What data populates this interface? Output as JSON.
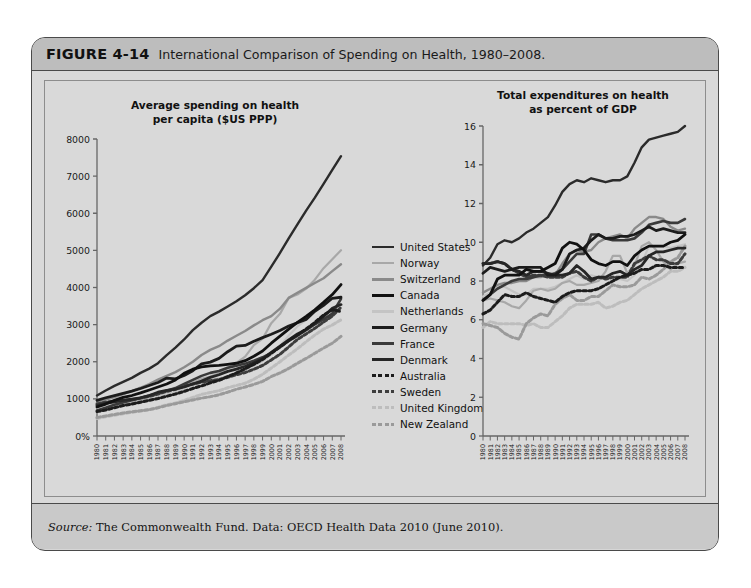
{
  "figure": {
    "number": "FIGURE 4-14",
    "caption": "International Comparison of Spending on Health, 1980–2008.",
    "source_prefix": "Source:",
    "source_text": " The Commonwealth Fund. Data: OECD Health Data 2010 (June 2010)."
  },
  "legend": {
    "items": [
      {
        "label": "United States",
        "color": "#2b2b2b",
        "style": "solid",
        "width": 2.4
      },
      {
        "label": "Norway",
        "color": "#a8a8a8",
        "style": "solid",
        "width": 2.2
      },
      {
        "label": "Switzerland",
        "color": "#8a8a8a",
        "style": "solid",
        "width": 2.4
      },
      {
        "label": "Canada",
        "color": "#111111",
        "style": "solid",
        "width": 2.8
      },
      {
        "label": "Netherlands",
        "color": "#c4c4c4",
        "style": "solid",
        "width": 2.2
      },
      {
        "label": "Germany",
        "color": "#1c1c1c",
        "style": "solid",
        "width": 2.8
      },
      {
        "label": "France",
        "color": "#3a3a3a",
        "style": "solid",
        "width": 2.6
      },
      {
        "label": "Denmark",
        "color": "#262626",
        "style": "solid",
        "width": 2.8
      },
      {
        "label": "Australia",
        "color": "#1c1c1c",
        "style": "dashed",
        "width": 3.0
      },
      {
        "label": "Sweden",
        "color": "#3d3d3d",
        "style": "dashed",
        "width": 3.0
      },
      {
        "label": "United Kingdom",
        "color": "#bdbdbd",
        "style": "dashed",
        "width": 3.0
      },
      {
        "label": "New Zealand",
        "color": "#9a9a9a",
        "style": "dashed",
        "width": 3.0
      }
    ]
  },
  "chart_data": [
    {
      "id": "spending-per-capita",
      "type": "line",
      "title": "Average spending on health\nper capita ($US PPP)",
      "xlabel": "",
      "ylabel": "",
      "ylim": [
        0,
        8000
      ],
      "yticks": [
        0,
        1000,
        2000,
        3000,
        4000,
        5000,
        6000,
        7000,
        8000
      ],
      "ytick_labels": [
        "0%",
        "1000",
        "2000",
        "3000",
        "4000",
        "5000",
        "6000",
        "7000",
        "8000"
      ],
      "grid": false,
      "legend_position": "right",
      "x": [
        1980,
        1981,
        1982,
        1983,
        1984,
        1985,
        1986,
        1987,
        1988,
        1989,
        1990,
        1991,
        1992,
        1993,
        1994,
        1995,
        1996,
        1997,
        1998,
        1999,
        2000,
        2001,
        2002,
        2003,
        2004,
        2005,
        2006,
        2007,
        2008
      ],
      "series": [
        {
          "name": "United States",
          "values": [
            1091,
            1226,
            1350,
            1460,
            1565,
            1700,
            1815,
            1960,
            2180,
            2380,
            2600,
            2850,
            3050,
            3230,
            3350,
            3490,
            3630,
            3790,
            3980,
            4200,
            4560,
            4930,
            5320,
            5700,
            6070,
            6420,
            6790,
            7170,
            7538
          ]
        },
        {
          "name": "Norway",
          "values": [
            680,
            740,
            790,
            840,
            890,
            960,
            1060,
            1170,
            1230,
            1280,
            1360,
            1440,
            1540,
            1600,
            1690,
            1830,
            1970,
            2140,
            2450,
            2620,
            3040,
            3290,
            3720,
            3810,
            3970,
            4210,
            4520,
            4760,
            5003
          ]
        },
        {
          "name": "Switzerland",
          "values": [
            900,
            980,
            1050,
            1130,
            1210,
            1300,
            1400,
            1520,
            1620,
            1720,
            1850,
            2000,
            2180,
            2320,
            2420,
            2570,
            2700,
            2830,
            2980,
            3120,
            3230,
            3430,
            3720,
            3860,
            3990,
            4120,
            4250,
            4440,
            4627
          ]
        },
        {
          "name": "Canada",
          "values": [
            780,
            860,
            960,
            1040,
            1090,
            1160,
            1240,
            1320,
            1400,
            1510,
            1690,
            1800,
            1860,
            1890,
            1900,
            1930,
            1960,
            2030,
            2150,
            2290,
            2500,
            2690,
            2880,
            3060,
            3220,
            3400,
            3600,
            3810,
            4079
          ]
        },
        {
          "name": "Netherlands",
          "values": [
            750,
            800,
            850,
            880,
            910,
            950,
            1000,
            1070,
            1120,
            1180,
            1280,
            1350,
            1460,
            1520,
            1550,
            1620,
            1690,
            1790,
            1890,
            2020,
            2190,
            2420,
            2700,
            2950,
            3130,
            3400,
            3590,
            3780,
            4063
          ]
        },
        {
          "name": "Germany",
          "values": [
            960,
            1030,
            1090,
            1150,
            1210,
            1280,
            1360,
            1440,
            1560,
            1540,
            1630,
            1760,
            1940,
            1990,
            2090,
            2270,
            2420,
            2440,
            2550,
            2650,
            2740,
            2840,
            2960,
            3050,
            3140,
            3360,
            3520,
            3710,
            3737
          ]
        },
        {
          "name": "France",
          "values": [
            690,
            760,
            840,
            900,
            960,
            1030,
            1090,
            1150,
            1220,
            1290,
            1400,
            1510,
            1620,
            1700,
            1750,
            1840,
            1890,
            1950,
            2030,
            2120,
            2240,
            2390,
            2560,
            2700,
            2850,
            3010,
            3140,
            3300,
            3696
          ]
        },
        {
          "name": "Denmark",
          "values": [
            820,
            880,
            920,
            960,
            990,
            1030,
            1090,
            1180,
            1230,
            1260,
            1320,
            1400,
            1480,
            1580,
            1650,
            1740,
            1800,
            1880,
            1970,
            2080,
            2250,
            2420,
            2590,
            2750,
            2870,
            3030,
            3220,
            3440,
            3540
          ]
        },
        {
          "name": "Australia",
          "values": [
            660,
            700,
            760,
            820,
            860,
            910,
            960,
            1010,
            1070,
            1130,
            1200,
            1280,
            1350,
            1430,
            1500,
            1600,
            1700,
            1810,
            1930,
            2060,
            2230,
            2400,
            2570,
            2720,
            2880,
            3060,
            3260,
            3400,
            3353
          ]
        },
        {
          "name": "Sweden",
          "values": [
            860,
            910,
            940,
            960,
            980,
            1020,
            1070,
            1130,
            1200,
            1260,
            1340,
            1400,
            1450,
            1490,
            1520,
            1580,
            1650,
            1710,
            1800,
            1900,
            2050,
            2200,
            2400,
            2600,
            2750,
            2900,
            3070,
            3230,
            3470
          ]
        },
        {
          "name": "United Kingdom",
          "values": [
            470,
            520,
            560,
            600,
            640,
            670,
            710,
            770,
            840,
            890,
            960,
            1040,
            1120,
            1170,
            1220,
            1300,
            1360,
            1420,
            1530,
            1660,
            1830,
            2000,
            2180,
            2350,
            2540,
            2720,
            2880,
            2990,
            3129
          ]
        },
        {
          "name": "New Zealand",
          "values": [
            500,
            540,
            580,
            620,
            650,
            680,
            710,
            760,
            820,
            870,
            920,
            970,
            1020,
            1060,
            1110,
            1180,
            1260,
            1320,
            1390,
            1470,
            1600,
            1700,
            1820,
            1960,
            2090,
            2230,
            2370,
            2500,
            2683
          ]
        }
      ]
    },
    {
      "id": "health-percent-gdp",
      "type": "line",
      "title": "Total expenditures on health\nas percent of GDP",
      "xlabel": "",
      "ylabel": "",
      "ylim": [
        0,
        16
      ],
      "yticks": [
        0,
        2,
        4,
        6,
        8,
        10,
        12,
        14,
        16
      ],
      "ytick_labels": [
        "0",
        "2",
        "4",
        "6",
        "8",
        "10",
        "12",
        "14",
        "16"
      ],
      "grid": false,
      "legend_position": "shared-left",
      "x": [
        1980,
        1981,
        1982,
        1983,
        1984,
        1985,
        1986,
        1987,
        1988,
        1989,
        1990,
        1991,
        1992,
        1993,
        1994,
        1995,
        1996,
        1997,
        1998,
        1999,
        2000,
        2001,
        2002,
        2003,
        2004,
        2005,
        2006,
        2007,
        2008
      ],
      "series": [
        {
          "name": "United States",
          "values": [
            8.8,
            9.2,
            9.9,
            10.1,
            10.0,
            10.2,
            10.5,
            10.7,
            11.0,
            11.3,
            11.9,
            12.6,
            13.0,
            13.2,
            13.1,
            13.3,
            13.2,
            13.1,
            13.2,
            13.2,
            13.4,
            14.1,
            14.9,
            15.3,
            15.4,
            15.5,
            15.6,
            15.7,
            16.0
          ]
        },
        {
          "name": "Norway",
          "values": [
            7.0,
            7.1,
            7.0,
            6.9,
            6.7,
            6.6,
            7.0,
            7.5,
            7.6,
            7.5,
            7.6,
            7.9,
            8.0,
            7.8,
            7.8,
            7.9,
            8.0,
            8.5,
            9.3,
            9.3,
            8.4,
            8.8,
            9.8,
            10.0,
            9.6,
            9.0,
            8.6,
            8.9,
            9.0
          ]
        },
        {
          "name": "Switzerland",
          "values": [
            7.4,
            7.6,
            7.8,
            7.9,
            7.9,
            8.0,
            8.0,
            8.2,
            8.2,
            8.3,
            8.3,
            8.9,
            9.4,
            9.6,
            9.5,
            9.6,
            10.0,
            10.2,
            10.3,
            10.4,
            10.2,
            10.7,
            11.0,
            11.3,
            11.3,
            11.2,
            10.8,
            10.6,
            10.7
          ]
        },
        {
          "name": "Canada",
          "values": [
            7.0,
            7.3,
            8.1,
            8.3,
            8.3,
            8.3,
            8.6,
            8.5,
            8.5,
            8.7,
            8.9,
            9.7,
            10.0,
            9.9,
            9.6,
            9.1,
            8.9,
            8.8,
            9.0,
            9.0,
            8.8,
            9.3,
            9.6,
            9.8,
            9.8,
            9.8,
            10.0,
            10.1,
            10.4
          ]
        },
        {
          "name": "Netherlands",
          "values": [
            7.2,
            7.4,
            7.7,
            7.7,
            7.5,
            7.3,
            7.3,
            7.6,
            7.6,
            7.6,
            7.7,
            7.9,
            8.1,
            8.3,
            8.1,
            8.3,
            8.2,
            8.1,
            8.1,
            8.1,
            8.0,
            8.3,
            8.9,
            9.8,
            9.8,
            9.8,
            9.7,
            9.8,
            9.9
          ]
        },
        {
          "name": "Germany",
          "values": [
            8.4,
            8.7,
            8.6,
            8.5,
            8.6,
            8.7,
            8.7,
            8.7,
            8.7,
            8.3,
            8.3,
            8.6,
            9.4,
            9.6,
            9.7,
            10.1,
            10.4,
            10.2,
            10.2,
            10.3,
            10.3,
            10.4,
            10.6,
            10.8,
            10.6,
            10.7,
            10.6,
            10.5,
            10.5
          ]
        },
        {
          "name": "France",
          "values": [
            7.0,
            7.3,
            7.6,
            7.8,
            8.0,
            8.1,
            8.1,
            8.2,
            8.3,
            8.3,
            8.4,
            8.6,
            9.0,
            9.4,
            9.4,
            10.4,
            10.4,
            10.2,
            10.1,
            10.1,
            10.1,
            10.2,
            10.5,
            10.9,
            11.0,
            11.1,
            11.0,
            11.0,
            11.2
          ]
        },
        {
          "name": "Denmark",
          "values": [
            8.9,
            8.9,
            9.0,
            8.9,
            8.6,
            8.5,
            8.3,
            8.5,
            8.5,
            8.4,
            8.3,
            8.3,
            8.4,
            8.8,
            8.5,
            8.1,
            8.2,
            8.2,
            8.4,
            8.5,
            8.3,
            8.6,
            8.8,
            9.3,
            9.5,
            9.5,
            9.6,
            9.7,
            9.7
          ]
        },
        {
          "name": "Australia",
          "values": [
            6.3,
            6.5,
            6.9,
            7.3,
            7.2,
            7.2,
            7.4,
            7.2,
            7.1,
            7.0,
            6.9,
            7.2,
            7.4,
            7.5,
            7.5,
            7.5,
            7.6,
            7.8,
            8.0,
            8.2,
            8.3,
            8.4,
            8.6,
            8.6,
            8.8,
            8.8,
            8.7,
            8.7,
            8.7
          ]
        },
        {
          "name": "Sweden",
          "values": [
            8.9,
            8.9,
            9.0,
            8.9,
            8.6,
            8.4,
            8.2,
            8.3,
            8.3,
            8.2,
            8.2,
            8.2,
            8.4,
            8.5,
            8.2,
            8.0,
            8.2,
            8.1,
            8.2,
            8.2,
            8.2,
            8.9,
            9.1,
            9.3,
            9.1,
            9.1,
            8.9,
            8.9,
            9.4
          ]
        },
        {
          "name": "United Kingdom",
          "values": [
            5.6,
            5.9,
            5.8,
            5.8,
            5.8,
            5.8,
            5.7,
            5.8,
            5.6,
            5.6,
            5.9,
            6.2,
            6.6,
            6.8,
            6.8,
            6.8,
            6.9,
            6.6,
            6.7,
            6.9,
            7.0,
            7.3,
            7.6,
            7.8,
            8.0,
            8.2,
            8.5,
            8.5,
            8.7
          ]
        },
        {
          "name": "New Zealand",
          "values": [
            5.8,
            5.7,
            5.6,
            5.3,
            5.1,
            5.0,
            5.8,
            6.1,
            6.3,
            6.2,
            6.8,
            7.1,
            7.3,
            7.0,
            7.0,
            7.2,
            7.2,
            7.5,
            7.8,
            7.7,
            7.7,
            7.8,
            8.2,
            8.1,
            8.3,
            8.6,
            9.0,
            9.2,
            9.8
          ]
        }
      ]
    }
  ]
}
